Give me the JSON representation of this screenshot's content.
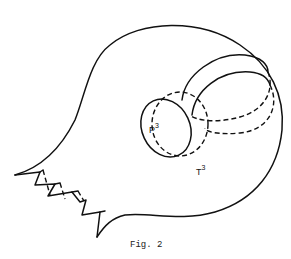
{
  "figure": {
    "caption": "Fig. 2",
    "labels": {
      "p": {
        "base": "P",
        "sup": "3",
        "sub": "1"
      },
      "t": {
        "base": "T",
        "sup": "3"
      }
    }
  },
  "colors": {
    "stroke": "#111111",
    "background": "#ffffff"
  }
}
